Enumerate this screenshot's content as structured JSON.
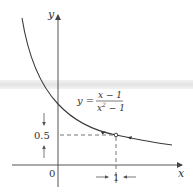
{
  "figure": {
    "type": "function-graph",
    "axes": {
      "x_label": "x",
      "y_label": "y",
      "origin_label": "0"
    },
    "equation": {
      "lhs": "y =",
      "numerator": "x − 1",
      "denominator": "x² − 1",
      "denominator_base": "x",
      "denominator_exp": "2",
      "denominator_rest": " − 1"
    },
    "limit_marks": {
      "y_value": "0.5",
      "x_value": "1"
    },
    "hole_point": {
      "x": 1,
      "y": 0.5
    },
    "colors": {
      "curve": "#3a3a3a",
      "axis": "#444444",
      "dash": "#555555",
      "artifact_band": "#e6e6e6"
    }
  }
}
